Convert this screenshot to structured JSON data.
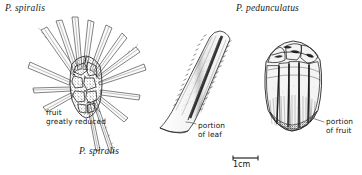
{
  "plate": {
    "width": 362,
    "height": 175,
    "background_color": "#ffffff",
    "ink_color": "#1b1b1b",
    "subject": "botanical-illustration-plate"
  },
  "labels": {
    "top_left_species": "P. spiralis",
    "top_right_species": "P. pedunculatus",
    "bottom_left_species": "P. spiralis"
  },
  "annotations": {
    "fruit_reduced": "fruit\ngreatly reduced",
    "portion_of_leaf": "portion\nof leaf",
    "portion_of_fruit": "portion\nof fruit"
  },
  "scale_bar": {
    "label": "1cm"
  },
  "figures": {
    "left": {
      "name": "spiralis-fruit-head-with-leaves",
      "description": "cone-like syncarp with radiating strap leaves"
    },
    "center": {
      "name": "serrated-leaf-blade",
      "description": "portion of leaf with spiny margins and dark midrib"
    },
    "right": {
      "name": "pedunculatus-syncarp",
      "description": "barrel shaped fruit with segmented drupes"
    }
  }
}
